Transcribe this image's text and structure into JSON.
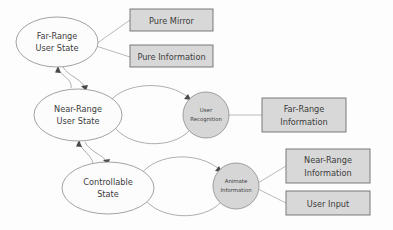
{
  "diagram": {
    "title": "",
    "colors": {
      "background": "#fdfdfd",
      "ellipse_fill": "#fcfcfc",
      "circle_fill": "#d6d6d6",
      "box_fill": "#d8d8d8",
      "shape_stroke": "#8a8a8a",
      "box_stroke": "#6e6e6e",
      "edge_stroke": "#9a9a9a",
      "arrow_fill": "#4a4a4a",
      "text_color": "#3c3c3c"
    },
    "states": [
      {
        "id": "far-range-user-state",
        "shape": "ellipse",
        "line1": "Far-Range",
        "line2": "User State",
        "cx": 57,
        "cy": 42,
        "rx": 41,
        "ry": 25
      },
      {
        "id": "near-range-user-state",
        "shape": "ellipse",
        "line1": "Near-Range",
        "line2": "User State",
        "cx": 78,
        "cy": 115,
        "rx": 44,
        "ry": 26
      },
      {
        "id": "controllable-state",
        "shape": "ellipse",
        "line1": "Controllable",
        "line2": "State",
        "cx": 108,
        "cy": 188,
        "rx": 46,
        "ry": 26
      }
    ],
    "processes": [
      {
        "id": "user-recognition",
        "shape": "circle",
        "line1": "User",
        "line2": "Recognition",
        "cx": 206,
        "cy": 115,
        "r": 23
      },
      {
        "id": "animate-information",
        "shape": "circle",
        "line1": "Animate",
        "line2": "Information",
        "cx": 236,
        "cy": 186,
        "r": 23
      }
    ],
    "boxes": [
      {
        "id": "pure-mirror",
        "line1": "Pure Mirror",
        "line2": "",
        "x": 130,
        "y": 9,
        "w": 83,
        "h": 22
      },
      {
        "id": "pure-information",
        "line1": "Pure Information",
        "line2": "",
        "x": 130,
        "y": 45,
        "w": 83,
        "h": 22
      },
      {
        "id": "far-range-information",
        "line1": "Far-Range",
        "line2": "Information",
        "x": 262,
        "y": 98,
        "w": 84,
        "h": 34
      },
      {
        "id": "near-range-information",
        "line1": "Near-Range",
        "line2": "Information",
        "x": 286,
        "y": 149,
        "w": 84,
        "h": 34
      },
      {
        "id": "user-input",
        "line1": "User Input",
        "line2": "",
        "x": 286,
        "y": 191,
        "w": 84,
        "h": 24
      }
    ],
    "connectors": [
      {
        "id": "far-to-near",
        "label": ""
      },
      {
        "id": "near-to-far",
        "label": ""
      },
      {
        "id": "near-to-controllable",
        "label": ""
      },
      {
        "id": "controllable-to-near",
        "label": ""
      },
      {
        "id": "near-to-user-recognition",
        "label": ""
      },
      {
        "id": "user-recognition-to-near",
        "label": ""
      },
      {
        "id": "controllable-to-animate",
        "label": ""
      },
      {
        "id": "animate-to-controllable",
        "label": ""
      },
      {
        "id": "far-range-to-pure-mirror",
        "label": ""
      },
      {
        "id": "far-range-to-pure-information",
        "label": ""
      },
      {
        "id": "user-recognition-to-far-range-information",
        "label": ""
      },
      {
        "id": "animate-to-near-range-information",
        "label": ""
      },
      {
        "id": "animate-to-user-input",
        "label": ""
      }
    ]
  }
}
